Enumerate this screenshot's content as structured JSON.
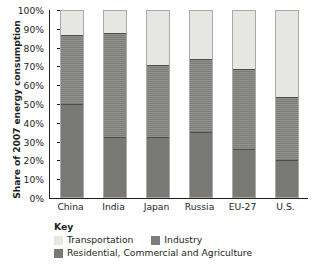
{
  "chart_data": {
    "type": "bar",
    "title": "",
    "subtitle": "",
    "xlabel": "",
    "ylabel": "Share of 2007 energy consumption",
    "stacked": true,
    "stack_mode": "percent",
    "grid": false,
    "legend_position": "bottom-left",
    "legend_title": "Key",
    "ylim": [
      0,
      100
    ],
    "ytick_labels": [
      "100%",
      "90%",
      "80%",
      "70%",
      "60%",
      "50%",
      "40%",
      "30%",
      "20%",
      "10%",
      "0%"
    ],
    "ytick_values": [
      100,
      90,
      80,
      70,
      60,
      50,
      40,
      30,
      20,
      10,
      0
    ],
    "categories": [
      "China",
      "India",
      "Japan",
      "Russia",
      "EU-27",
      "U.S."
    ],
    "series": [
      {
        "name": "Residential, Commercial and Agriculture",
        "color": "#787874",
        "values": [
          50,
          32,
          32,
          35,
          26,
          20
        ]
      },
      {
        "name": "Industry",
        "color": "#7c7c78",
        "values": [
          37,
          56,
          39,
          39,
          43,
          34
        ]
      },
      {
        "name": "Transportation",
        "color": "#e6e6e2",
        "values": [
          13,
          12,
          29,
          26,
          31,
          46
        ]
      }
    ]
  },
  "axis": {
    "y_title": "Share of 2007 energy consumption",
    "ticks": [
      {
        "label": "100%",
        "value": 100
      },
      {
        "label": "90%",
        "value": 90
      },
      {
        "label": "80%",
        "value": 80
      },
      {
        "label": "70%",
        "value": 70
      },
      {
        "label": "60%",
        "value": 60
      },
      {
        "label": "50%",
        "value": 50
      },
      {
        "label": "40%",
        "value": 40
      },
      {
        "label": "30%",
        "value": 30
      },
      {
        "label": "20%",
        "value": 20
      },
      {
        "label": "10%",
        "value": 10
      },
      {
        "label": "0%",
        "value": 0
      }
    ]
  },
  "categories": [
    {
      "label": "China",
      "transportation": 13,
      "industry": 37,
      "residential": 50
    },
    {
      "label": "India",
      "transportation": 12,
      "industry": 56,
      "residential": 32
    },
    {
      "label": "Japan",
      "transportation": 29,
      "industry": 39,
      "residential": 32
    },
    {
      "label": "Russia",
      "transportation": 26,
      "industry": 39,
      "residential": 35
    },
    {
      "label": "EU-27",
      "transportation": 31,
      "industry": 43,
      "residential": 26
    },
    {
      "label": "U.S.",
      "transportation": 46,
      "industry": 34,
      "residential": 20
    }
  ],
  "legend": {
    "title": "Key",
    "items": [
      {
        "label": "Transportation",
        "color": "#e6e6e2"
      },
      {
        "label": "Industry",
        "color": "#7c7c78"
      },
      {
        "label": "Residential, Commercial and Agriculture",
        "color": "#787874"
      }
    ]
  }
}
